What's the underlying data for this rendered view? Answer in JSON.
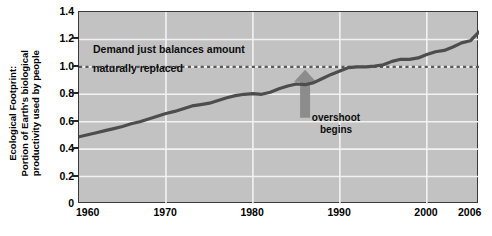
{
  "chart_data": {
    "type": "line",
    "title": "",
    "xlabel": "",
    "ylabel": "Ecological Footprint: Portion of Earth's biological productivity used by people",
    "ylabel_lines": [
      "Ecological Footprint:",
      "Portion of Earth's biological",
      "productivity used by people"
    ],
    "xlim": [
      1960,
      2006
    ],
    "ylim": [
      0,
      1.4
    ],
    "yticks": [
      "1.4",
      "1.2",
      "1.0",
      "0.8",
      "0.6",
      "0.4",
      "0.2",
      "0"
    ],
    "ytick_values": [
      1.4,
      1.2,
      1.0,
      0.8,
      0.6,
      0.4,
      0.2,
      0
    ],
    "xticks": [
      "1960",
      "1970",
      "1980",
      "1990",
      "2000",
      "2006"
    ],
    "xtick_values": [
      1960,
      1970,
      1980,
      1990,
      2000,
      2006
    ],
    "grid": true,
    "grid_color": "#f2f2f2",
    "plot_bg": "#c2c2c2",
    "line_color": "#4d4d4d",
    "reference_line": {
      "value": 1.0,
      "style": "dashed",
      "color": "#5a5a5a",
      "label_line_1": "Demand just balances amount",
      "label_line_2": "naturally replaced"
    },
    "annotations": [
      {
        "name": "overshoot-begins",
        "text_line_1": "overshoot",
        "text_line_2": "begins",
        "arrow": "up",
        "arrow_color": "#8c8c8c",
        "points_to_x": 1986,
        "points_to_y": 1.0
      }
    ],
    "x": [
      1960,
      1961,
      1962,
      1963,
      1964,
      1965,
      1966,
      1967,
      1968,
      1969,
      1970,
      1971,
      1972,
      1973,
      1974,
      1975,
      1976,
      1977,
      1978,
      1979,
      1980,
      1981,
      1982,
      1983,
      1984,
      1985,
      1986,
      1987,
      1988,
      1989,
      1990,
      1991,
      1992,
      1993,
      1994,
      1995,
      1996,
      1997,
      1998,
      1999,
      2000,
      2001,
      2002,
      2003,
      2004,
      2005,
      2006
    ],
    "values": [
      0.49,
      0.505,
      0.52,
      0.535,
      0.55,
      0.565,
      0.585,
      0.6,
      0.62,
      0.64,
      0.66,
      0.675,
      0.695,
      0.715,
      0.725,
      0.735,
      0.755,
      0.775,
      0.79,
      0.8,
      0.805,
      0.8,
      0.815,
      0.84,
      0.86,
      0.875,
      0.87,
      0.885,
      0.915,
      0.945,
      0.97,
      0.995,
      1.0,
      1.0,
      1.005,
      1.015,
      1.04,
      1.055,
      1.055,
      1.065,
      1.09,
      1.11,
      1.12,
      1.145,
      1.175,
      1.19,
      1.255
    ],
    "series_name": "Ecological Footprint"
  }
}
